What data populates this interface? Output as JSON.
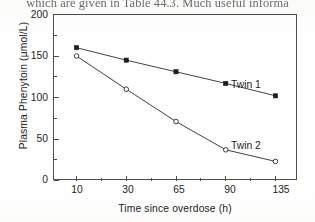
{
  "page": {
    "running_text": "which are given in Table 44.3. Much useful informa"
  },
  "chart_data": {
    "type": "line",
    "title": "",
    "xlabel": "Time since overdose (h)",
    "ylabel": "Plasma Phenytoin (µmol/L)",
    "categories": [
      "10",
      "30",
      "65",
      "90",
      "135"
    ],
    "x_tick_labels": [
      "10",
      "30",
      "65",
      "90",
      "135"
    ],
    "y_tick_labels": [
      "0",
      "50",
      "100",
      "150",
      "200"
    ],
    "y_tick_values": [
      0,
      50,
      100,
      150,
      200
    ],
    "y_minor_tick_values": [
      25,
      75,
      125,
      175
    ],
    "ylim": [
      0,
      200
    ],
    "x_scale": "categorical",
    "grid": false,
    "legend_position": "inline-right",
    "series": [
      {
        "name": "Twin 1",
        "marker": "filled-square",
        "values": [
          160,
          145,
          131,
          117,
          102
        ]
      },
      {
        "name": "Twin 2",
        "marker": "open-circle",
        "values": [
          150,
          110,
          71,
          37,
          23
        ]
      }
    ],
    "annotations": [
      {
        "text": "Twin 1",
        "series": "Twin 1"
      },
      {
        "text": "Twin 2",
        "series": "Twin 2"
      }
    ]
  }
}
